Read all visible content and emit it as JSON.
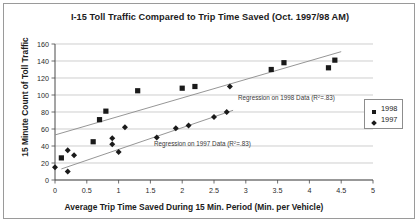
{
  "chart_data": {
    "type": "scatter",
    "title": "I-15 Toll Traffic Compared to Trip Time Saved (Oct. 1997/98 AM)",
    "xlabel": "Average Trip Time Saved During 15 Min. Period (Min. per Vehicle)",
    "ylabel": "15 Minute Count of Toll Traffic",
    "xlim": [
      0,
      5
    ],
    "ylim": [
      0,
      160
    ],
    "xticks": [
      "0",
      "0.5",
      "1",
      "1.5",
      "2",
      "2.5",
      "3",
      "3.5",
      "4",
      "4.5",
      "5"
    ],
    "yticks": [
      "0",
      "20",
      "40",
      "60",
      "80",
      "100",
      "120",
      "140",
      "160"
    ],
    "grid": "horizontal",
    "legend_position": "right",
    "series": [
      {
        "name": "1998",
        "marker": "square",
        "color": "#1a1a1a",
        "points": [
          [
            0.1,
            26
          ],
          [
            0.6,
            45
          ],
          [
            0.7,
            71
          ],
          [
            0.8,
            81
          ],
          [
            1.3,
            105
          ],
          [
            2.0,
            108
          ],
          [
            2.2,
            110
          ],
          [
            3.4,
            130
          ],
          [
            3.6,
            138
          ],
          [
            4.3,
            132
          ],
          [
            4.4,
            141
          ]
        ]
      },
      {
        "name": "1997",
        "marker": "diamond",
        "color": "#1a1a1a",
        "points": [
          [
            0.0,
            15
          ],
          [
            0.2,
            35
          ],
          [
            0.2,
            10
          ],
          [
            0.3,
            29
          ],
          [
            0.9,
            49
          ],
          [
            0.9,
            42
          ],
          [
            1.0,
            33
          ],
          [
            1.1,
            62
          ],
          [
            1.6,
            50
          ],
          [
            1.9,
            61
          ],
          [
            2.1,
            64
          ],
          [
            2.5,
            74
          ],
          [
            2.7,
            80
          ],
          [
            2.75,
            110
          ]
        ]
      }
    ],
    "trendlines": [
      {
        "name": "Regression on 1998 Data",
        "label": "Regression on 1998 Data (R",
        "label_sup": "2",
        "label_tail": "=.83)",
        "r_squared": ".83",
        "from": [
          0.0,
          53
        ],
        "to": [
          4.5,
          151
        ]
      },
      {
        "name": "Regression on 1997 Data",
        "label": "Regression on 1997 Data (R",
        "label_sup": "2",
        "label_tail": "=.83)",
        "r_squared": ".83",
        "from": [
          0.1,
          13
        ],
        "to": [
          2.8,
          82
        ]
      }
    ]
  },
  "legend": {
    "items": [
      {
        "label": "1998",
        "marker": "square"
      },
      {
        "label": "1997",
        "marker": "diamond"
      }
    ]
  }
}
